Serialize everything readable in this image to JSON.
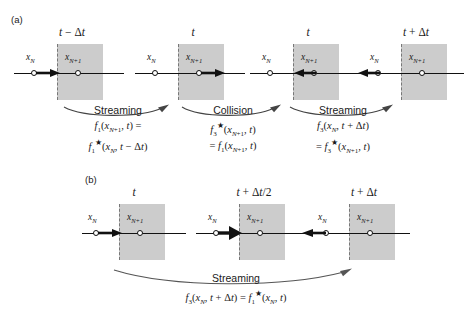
{
  "figure": {
    "colors": {
      "cell_shade": "#cccccc",
      "line": "#111111",
      "dashed_wall": "#777777",
      "background": "#ffffff"
    }
  },
  "panels": [
    {
      "id": "a",
      "label": "(a)",
      "scheme": "full-way bounce-back",
      "cells": [
        {
          "name": "cell-a1",
          "time_label": "t − Δt",
          "left_node_label": "x",
          "left_node_sub": "N",
          "right_node_label": "x",
          "right_node_sub": "N+1",
          "arrow_direction": "right",
          "arrow_at": "left-node",
          "arrow_weight": "bold"
        },
        {
          "name": "cell-a2",
          "time_label": "t",
          "left_node_label": "x",
          "left_node_sub": "N",
          "right_node_label": "x",
          "right_node_sub": "N+1",
          "arrow_direction": "right",
          "arrow_at": "right-node",
          "arrow_weight": "bold"
        },
        {
          "name": "cell-a3",
          "time_label": "t",
          "left_node_label": "x",
          "left_node_sub": "N",
          "right_node_label": "x",
          "right_node_sub": "N+1",
          "arrow_direction": "left",
          "arrow_at": "right-node",
          "arrow_weight": "bold"
        },
        {
          "name": "cell-a4",
          "time_label": "t + Δt",
          "left_node_label": "x",
          "left_node_sub": "N",
          "right_node_label": "x",
          "right_node_sub": "N+1",
          "arrow_direction": "left",
          "arrow_at": "left-node",
          "arrow_weight": "bold"
        }
      ],
      "processes": [
        {
          "name": "process-a-streaming-1",
          "caption": "Streaming",
          "equation_lines": [
            "f₁(x_{N+1}, t) =",
            "f₁*(x_N, t − Δt)"
          ]
        },
        {
          "name": "process-a-collision",
          "caption": "Collision",
          "equation_lines": [
            "f₃*(x_{N+1}, t)",
            "= f₁(x_{N+1}, t)"
          ]
        },
        {
          "name": "process-a-streaming-2",
          "caption": "Streaming",
          "equation_lines": [
            "f₃(x_N, t + Δt)",
            "= f₃*(x_{N+1}, t)"
          ]
        }
      ]
    },
    {
      "id": "b",
      "label": "(b)",
      "scheme": "half-way bounce-back",
      "cells": [
        {
          "name": "cell-b1",
          "time_label": "t",
          "left_node_label": "x",
          "left_node_sub": "N",
          "right_node_label": "x",
          "right_node_sub": "N+1",
          "arrow_direction": "right",
          "arrow_at": "left-node",
          "arrow_weight": "bold"
        },
        {
          "name": "cell-b2",
          "time_label": "t + Δt/2",
          "left_node_label": "x",
          "left_node_sub": "N",
          "right_node_label": "x",
          "right_node_sub": "N+1",
          "arrow_direction": "right",
          "arrow_at": "wall",
          "arrow_weight": "heavy"
        },
        {
          "name": "cell-b3",
          "time_label": "t + Δt",
          "left_node_label": "x",
          "left_node_sub": "N",
          "right_node_label": "x",
          "right_node_sub": "N+1",
          "arrow_direction": "left",
          "arrow_at": "left-node",
          "arrow_weight": "bold"
        }
      ],
      "processes": [
        {
          "name": "process-b-streaming",
          "caption": "Streaming",
          "equation_lines": [
            "f₃(x_N, t + Δt) = f₁*(x_N, t)"
          ]
        }
      ]
    }
  ],
  "labels": {
    "panel_a": "(a)",
    "panel_b": "(b)",
    "time_a1": "t − Δt",
    "time_a2": "t",
    "time_a3": "t",
    "time_a4": "t + Δt",
    "time_b1": "t",
    "time_b2": "t + Δt/2",
    "time_b3": "t + Δt",
    "x_n": "x",
    "x_n_sub": "N",
    "x_np1": "x",
    "x_np1_sub": "N+1",
    "streaming": "Streaming",
    "collision": "Collision"
  }
}
